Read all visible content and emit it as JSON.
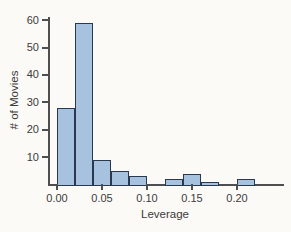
{
  "figure": {
    "background_color": "#fbfaf7"
  },
  "chart_data": {
    "type": "bar",
    "subtype": "histogram",
    "title": "",
    "xlabel": "Leverage",
    "ylabel": "# of Movies",
    "bin_edges": [
      0.0,
      0.02,
      0.04,
      0.06,
      0.08,
      0.1,
      0.12,
      0.14,
      0.16,
      0.18,
      0.2,
      0.22
    ],
    "counts": [
      28,
      59,
      9,
      5,
      3,
      0,
      2,
      4,
      1,
      0,
      2
    ],
    "x_ticks": [
      {
        "value": 0.0,
        "label": "0.00"
      },
      {
        "value": 0.05,
        "label": "0.05"
      },
      {
        "value": 0.1,
        "label": "0.10"
      },
      {
        "value": 0.15,
        "label": "0.15"
      },
      {
        "value": 0.2,
        "label": "0.20"
      }
    ],
    "y_ticks": [
      {
        "value": 10,
        "label": "10"
      },
      {
        "value": 20,
        "label": "20"
      },
      {
        "value": 30,
        "label": "30"
      },
      {
        "value": 40,
        "label": "40"
      },
      {
        "value": 50,
        "label": "50"
      },
      {
        "value": 60,
        "label": "60"
      }
    ],
    "xlim": [
      -0.01,
      0.235
    ],
    "ylim": [
      0,
      61
    ],
    "grid": false,
    "legend": null,
    "bar_fill_color": "#a6c2df",
    "bar_border_color": "#2b3950",
    "axis_color": "#4f4f4f",
    "text_color": "#3b3b3b"
  }
}
